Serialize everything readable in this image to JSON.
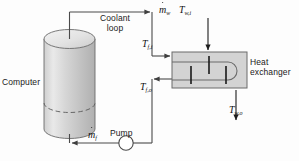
{
  "diagram": {
    "background_color": "#fdfdfd",
    "line_color": "#4a4a4a",
    "text_color": "#1a1a1a",
    "labels": {
      "computer": "Computer",
      "coolant_loop": "Coolant\nloop",
      "heat_exchanger": "Heat\nexchanger",
      "pump": "Pump"
    },
    "symbols": {
      "fluid_inlet_temp": {
        "base": "T",
        "sub": "f,i"
      },
      "fluid_outlet_temp": {
        "base": "T",
        "sub": "f,o"
      },
      "water_inlet_temp": {
        "base": "T",
        "sub": "w,i"
      },
      "water_outlet_temp": {
        "base": "T",
        "sub": "w,o"
      },
      "water_mass_flow": {
        "base": "m",
        "sub": "w",
        "accent": "dot"
      },
      "fluid_mass_flow": {
        "base": "m",
        "sub": "f",
        "accent": "dot"
      }
    },
    "components": {
      "computer_shape": "cylinder",
      "heat_exchanger_shape": "shell-and-tube-box",
      "pump_shape": "circle",
      "heat_exchanger_fill": "#d3d3d3",
      "cylinder_fill_light": "#f0f0f0",
      "cylinder_fill_dark": "#b8b8b8"
    }
  }
}
